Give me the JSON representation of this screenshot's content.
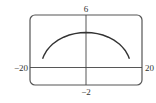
{
  "chart_data": {
    "type": "line",
    "title": "",
    "xlabel": "",
    "ylabel": "",
    "xlim": [
      -20,
      20
    ],
    "ylim": [
      -2,
      6
    ],
    "grid": false,
    "tick_labels": {
      "x_min": "−20",
      "x_max": "20",
      "y_max": "6",
      "y_min": "−2"
    },
    "series": [
      {
        "name": "curve",
        "x": [
          -15.5,
          -15,
          -14,
          -13,
          -12,
          -10,
          -8,
          -6,
          -4,
          -2,
          0,
          2,
          4,
          6,
          8,
          10,
          12,
          13,
          14,
          15,
          15.5
        ],
        "y": [
          0.99,
          1.39,
          1.94,
          2.33,
          2.65,
          3.12,
          3.46,
          3.71,
          3.87,
          3.97,
          4.0,
          3.97,
          3.87,
          3.71,
          3.46,
          3.12,
          2.65,
          2.33,
          1.94,
          1.39,
          0.99
        ]
      }
    ],
    "colors": {
      "frame": "#555555",
      "axes": "#444444",
      "curve": "#333333"
    }
  }
}
